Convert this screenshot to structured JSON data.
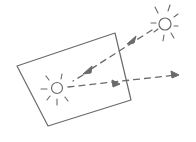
{
  "diagram": {
    "colors": {
      "background": "#ffffff",
      "ink": "#6a6a6a"
    },
    "panel": {
      "shape": "quadrilateral",
      "corners": [
        [
          17,
          66
        ],
        [
          115,
          33
        ],
        [
          131,
          100
        ],
        [
          48,
          126
        ]
      ]
    },
    "light_sources": [
      {
        "id": "outer-sun",
        "icon": "sun-icon",
        "center": [
          165,
          24
        ],
        "radius": 6
      },
      {
        "id": "inner-sun",
        "icon": "sun-icon",
        "center": [
          57,
          88
        ],
        "radius": 5.5
      }
    ],
    "arrows": [
      {
        "id": "incoming-ray",
        "style": "dashed",
        "from": [
          152,
          30
        ],
        "to": [
          85,
          73
        ],
        "heads": [
          [
            130,
            43
          ],
          [
            85,
            73
          ]
        ]
      },
      {
        "id": "outgoing-ray",
        "style": "dashed",
        "from": [
          68,
          87
        ],
        "to": [
          178,
          75
        ],
        "heads": [
          [
            117,
            84
          ],
          [
            178,
            75
          ]
        ]
      }
    ]
  }
}
